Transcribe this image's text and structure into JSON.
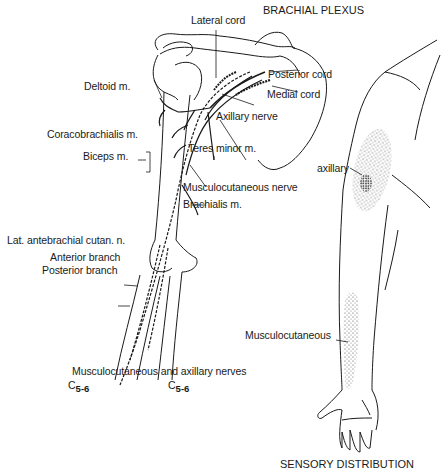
{
  "titles": {
    "brachial_plexus": "BRACHIAL PLEXUS",
    "sensory_distribution": "SENSORY DISTRIBUTION",
    "caption": "Musculocutaneous and axillary nerves"
  },
  "segments": {
    "left": {
      "root": "C",
      "sub": "5-6"
    },
    "right": {
      "root": "C",
      "sub": "5-6"
    }
  },
  "labels": {
    "lateral_cord": "Lateral cord",
    "posterior_cord": "Posterior cord",
    "medial_cord": "Medial cord",
    "deltoid": "Deltoid m.",
    "axillary_nerve": "Axillary nerve",
    "coracobrachialis": "Coracobrachialis m.",
    "teres_minor": "Teres minor m.",
    "biceps": "Biceps m.",
    "musculocutaneous_nerve": "Musculocutaneous nerve",
    "brachialis": "Brachialis m.",
    "lat_antebrachial": "Lat. antebrachial cutan. n.",
    "anterior_branch": "Anterior branch",
    "posterior_branch": "Posterior branch",
    "sensory_axillary": "axillary",
    "sensory_musculocutaneous": "Musculocutaneous"
  },
  "colors": {
    "ink": "#1a1a1a",
    "stipple": "#555555"
  }
}
